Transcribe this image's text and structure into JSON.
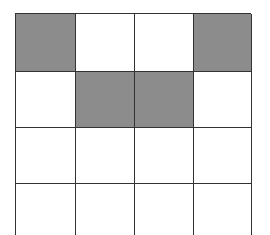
{
  "diagram": {
    "type": "grid",
    "rows": 4,
    "columns": 4,
    "colors": {
      "filled": "#8c8c8c",
      "empty": "#ffffff",
      "line": "#333333"
    },
    "cells": [
      [
        1,
        0,
        0,
        1
      ],
      [
        0,
        1,
        1,
        0
      ],
      [
        0,
        0,
        0,
        0
      ],
      [
        0,
        0,
        0,
        0
      ]
    ]
  }
}
